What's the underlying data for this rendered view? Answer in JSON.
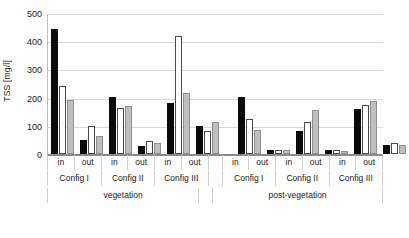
{
  "chart_data": {
    "type": "bar",
    "title": "",
    "xlabel": "",
    "ylabel": "TSS [mg/l]",
    "ylim": [
      0,
      500
    ],
    "yticks": [
      500,
      400,
      300,
      200,
      100,
      0
    ],
    "grid": true,
    "legend": "none",
    "series": [
      {
        "name": "series-black",
        "color": "#0a0a0a",
        "values": [
          443,
          48,
          203,
          30,
          182,
          100,
          202,
          13,
          80,
          14,
          160,
          33
        ]
      },
      {
        "name": "series-white",
        "color": "#ffffff",
        "values": [
          240,
          100,
          163,
          45,
          417,
          83,
          125,
          13,
          112,
          16,
          175,
          40
        ]
      },
      {
        "name": "series-gray",
        "color": "#bfbfbf",
        "values": [
          190,
          63,
          172,
          38,
          216,
          115,
          86,
          15,
          155,
          11,
          188,
          33
        ]
      }
    ],
    "categories": [
      "in",
      "out",
      "in",
      "out",
      "in",
      "out",
      "in",
      "out",
      "in",
      "out",
      "in",
      "out"
    ],
    "group_labels": [
      "Config I",
      "Config II",
      "Config III",
      "Config I",
      "Config II",
      "Config III"
    ],
    "section_labels": [
      "vegetation",
      "post-vegetation"
    ]
  },
  "axis": {
    "y_title": "TSS [mg/l]",
    "y_ticks": [
      "500",
      "400",
      "300",
      "200",
      "100",
      "0"
    ]
  },
  "x_tier1": [
    "in",
    "out",
    "in",
    "out",
    "in",
    "out",
    "in",
    "out",
    "in",
    "out",
    "in",
    "out"
  ],
  "x_tier2": [
    "Config I",
    "Config II",
    "Config III",
    "Config I",
    "Config II",
    "Config III"
  ],
  "x_tier3": [
    "vegetation",
    "post-vegetation"
  ]
}
